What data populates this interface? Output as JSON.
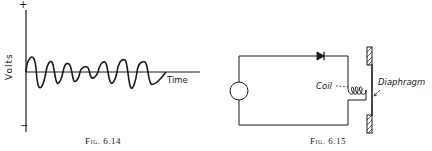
{
  "figures": [
    {
      "id": "fig-6-14",
      "caption": "Fig. 6.14",
      "y_axis": {
        "label": "Volts",
        "top_sign": "+",
        "bottom_sign": "−"
      },
      "x_axis": {
        "label": "Time"
      },
      "waveform": {
        "description": "modulated oscillating voltage wave about the time axis",
        "cycles": 7
      }
    },
    {
      "id": "fig-6-15",
      "caption": "Fig. 6.15",
      "components": [
        "source",
        "diode",
        "coil",
        "diaphragm"
      ],
      "labels": {
        "coil": "Coil",
        "diaphragm": "Diaphragm"
      }
    }
  ],
  "colors": {
    "ink": "#1a1a1a",
    "paper": "#ffffff"
  }
}
